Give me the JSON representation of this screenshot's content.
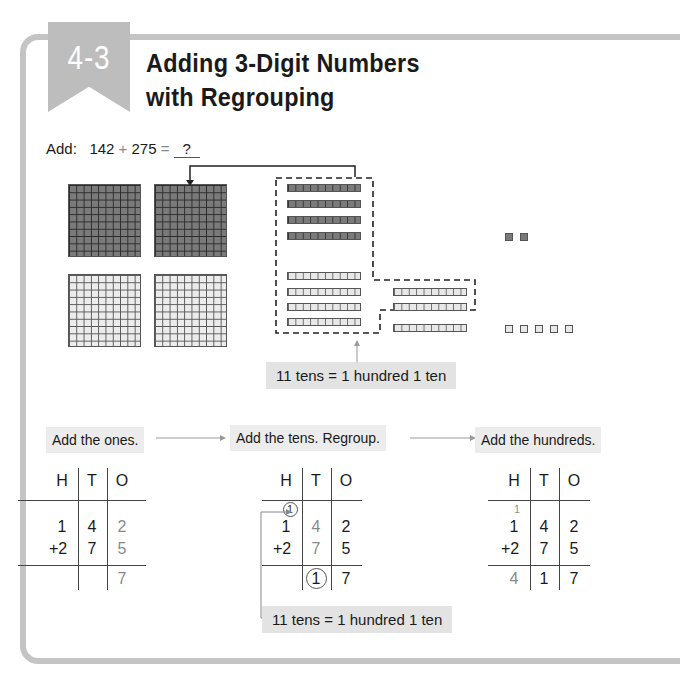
{
  "lesson": {
    "number": "4-3",
    "title_line1": "Adding 3-Digit Numbers",
    "title_line2": "with Regrouping"
  },
  "problem": {
    "prefix": "Add:",
    "addend1": "142",
    "plus": "+",
    "addend2": "275",
    "equals": "=",
    "answer_blank": "?"
  },
  "model": {
    "hundreds_dark": 1,
    "hundreds_light": 2,
    "tens_dark": 4,
    "tens_light": 7,
    "ones_dark": 2,
    "ones_light": 5,
    "callout": "11 tens = 1 hundred 1 ten"
  },
  "steps": [
    {
      "label": "Add the ones."
    },
    {
      "label": "Add the tens. Regroup."
    },
    {
      "label": "Add the hundreds."
    }
  ],
  "tables": [
    {
      "headers": [
        "H",
        "T",
        "O"
      ],
      "carry": "",
      "row1": [
        "1",
        "4",
        "2"
      ],
      "row2": [
        "+2",
        "7",
        "5"
      ],
      "result": [
        "",
        "",
        "7"
      ]
    },
    {
      "headers": [
        "H",
        "T",
        "O"
      ],
      "carry": "1",
      "row1": [
        "1",
        "4",
        "2"
      ],
      "row2": [
        "+2",
        "7",
        "5"
      ],
      "result": [
        "",
        "1",
        "7"
      ],
      "note": "11 tens = 1 hundred 1 ten"
    },
    {
      "headers": [
        "H",
        "T",
        "O"
      ],
      "carry": "1",
      "row1": [
        "1",
        "4",
        "2"
      ],
      "row2": [
        "+2",
        "7",
        "5"
      ],
      "result": [
        "4",
        "1",
        "7"
      ]
    }
  ],
  "colors": {
    "frame": "#c4c4c4",
    "ribbon": "#bdbdbd",
    "callout_bg": "#e3e3e3",
    "dark_block": "#7a7a7a",
    "light_block": "#e8e8e8"
  }
}
